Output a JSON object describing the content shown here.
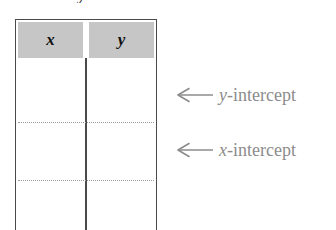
{
  "figure": {
    "clipped_caption_fragment": "y",
    "table": {
      "columns": [
        {
          "header": "x",
          "name": "x-column"
        },
        {
          "header": "y",
          "name": "y-column"
        }
      ],
      "rows": [
        {
          "x": "",
          "y": ""
        },
        {
          "x": "",
          "y": ""
        },
        {
          "x": "",
          "y": ""
        }
      ],
      "row_rules": [
        {
          "id": "rule-1",
          "style": "dotted"
        },
        {
          "id": "rule-2",
          "style": "dotted"
        }
      ],
      "header_background": "#c6c6c6",
      "border_color": "#4a4a4a",
      "rule_color": "#9a9a9a"
    },
    "annotations": [
      {
        "id": "y-intercept",
        "arrow": "left-arrow-icon",
        "variable": "y",
        "suffix": "-intercept",
        "color": "#8c8c8c"
      },
      {
        "id": "x-intercept",
        "arrow": "left-arrow-icon",
        "variable": "x",
        "suffix": "-intercept",
        "color": "#8c8c8c"
      }
    ]
  }
}
